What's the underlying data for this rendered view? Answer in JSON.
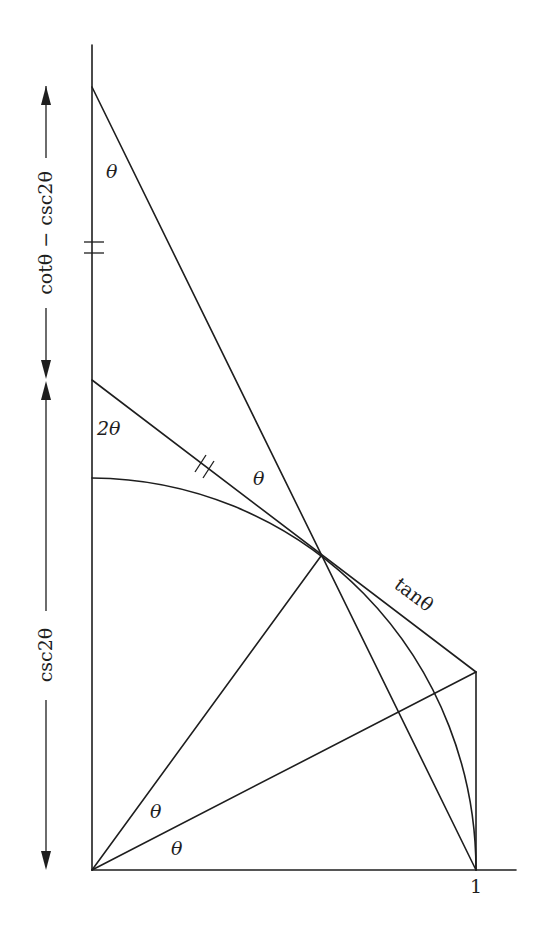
{
  "figure": {
    "angle_labels": {
      "top_vertex": "θ",
      "upper_vertex": "2θ",
      "tangent_line": "θ",
      "origin_upper": "θ",
      "origin_lower": "θ"
    },
    "segment_labels": {
      "tangent": "tanθ",
      "axis_unit": "1"
    },
    "dimension_labels": {
      "upper": "cotθ − csc2θ",
      "lower": "csc2θ"
    },
    "tick_marks": {
      "vertical_axis": "double tick",
      "slanted_segment": "double tick"
    },
    "colors": {
      "ink": "#1e1e1e",
      "background": "#ffffff"
    }
  }
}
